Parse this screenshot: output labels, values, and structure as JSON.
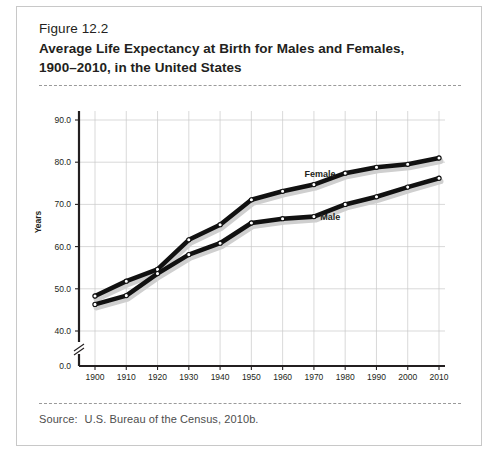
{
  "figure": {
    "number": "Figure 12.2",
    "title_line1": "Average Life Expectancy at Birth for Males and Females,",
    "title_line2": "1900–2010, in the United States",
    "source_label": "Source:",
    "source_text": "U.S. Bureau of the Census, 2010b."
  },
  "chart_data": {
    "type": "line",
    "title": "Average Life Expectancy at Birth for Males and Females, 1900–2010, in the United States",
    "xlabel": "",
    "ylabel": "Years",
    "x": [
      1900,
      1910,
      1920,
      1930,
      1940,
      1950,
      1960,
      1970,
      1980,
      1990,
      2000,
      2010
    ],
    "xtick_labels": [
      "1900",
      "1910",
      "1920",
      "1930",
      "1940",
      "1950",
      "1960",
      "1970",
      "1980",
      "1990",
      "2000",
      "2010"
    ],
    "xlim": [
      1900,
      2010
    ],
    "ytick_labels": [
      "0.0",
      "40.0",
      "50.0",
      "60.0",
      "70.0",
      "80.0",
      "90.0"
    ],
    "yticks": [
      0.0,
      40.0,
      50.0,
      60.0,
      70.0,
      80.0,
      90.0
    ],
    "ylim": [
      40.0,
      90.0
    ],
    "y_axis_break": true,
    "y_axis_break_label": "0.0",
    "grid": true,
    "legend_position": "inline-labels",
    "series": [
      {
        "name": "Female",
        "label": "Female",
        "color": "#111111",
        "values": [
          48.3,
          51.8,
          54.6,
          61.6,
          65.2,
          71.1,
          73.1,
          74.7,
          77.4,
          78.8,
          79.5,
          81.0
        ]
      },
      {
        "name": "Male",
        "label": "Male",
        "color": "#111111",
        "values": [
          46.3,
          48.4,
          53.6,
          58.1,
          60.8,
          65.6,
          66.6,
          67.1,
          70.0,
          71.8,
          74.1,
          76.2
        ]
      }
    ]
  }
}
